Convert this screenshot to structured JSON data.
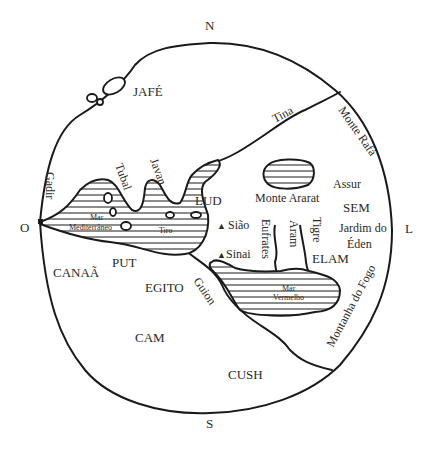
{
  "map": {
    "title": "Mapa-múndi da Tabela das Nações",
    "compass": {
      "north": "N",
      "south": "S",
      "east": "L",
      "west": "O"
    },
    "regions": [
      {
        "id": "jafe",
        "label": "JAFÉ"
      },
      {
        "id": "sem",
        "label": "SEM"
      },
      {
        "id": "cam",
        "label": "CAM"
      },
      {
        "id": "canaa",
        "label": "CANAÃ"
      },
      {
        "id": "put",
        "label": "PUT"
      },
      {
        "id": "egito",
        "label": "EGITO"
      },
      {
        "id": "cush",
        "label": "CUSH"
      },
      {
        "id": "lud",
        "label": "LUD"
      },
      {
        "id": "elam",
        "label": "ELAM"
      },
      {
        "id": "assur",
        "label": "Assur"
      }
    ],
    "places": [
      {
        "id": "gadir",
        "label": "Gadir"
      },
      {
        "id": "tubal",
        "label": "Tubal"
      },
      {
        "id": "javan",
        "label": "Javan"
      },
      {
        "id": "tiro",
        "label": "Tiro"
      },
      {
        "id": "tina",
        "label": "Tina"
      },
      {
        "id": "aram",
        "label": "Aram"
      },
      {
        "id": "guion",
        "label": "Guion"
      },
      {
        "id": "jardim",
        "label_line1": "Jardim do",
        "label_line2": "Éden"
      }
    ],
    "mountains": [
      {
        "id": "siao",
        "label": "Sião",
        "symbol": "▲"
      },
      {
        "id": "sinai",
        "label": "Sinai",
        "symbol": "▲"
      },
      {
        "id": "ararat",
        "label": "Monte Ararat"
      },
      {
        "id": "rafa",
        "label": "Monte Rafá"
      },
      {
        "id": "fogo",
        "label": "Montanha do Fogo"
      }
    ],
    "rivers": [
      {
        "id": "eufrates",
        "label": "Eufrates"
      },
      {
        "id": "tigre",
        "label": "Tigre"
      }
    ],
    "seas": [
      {
        "id": "mediterraneo",
        "label_line1": "Mar",
        "label_line2": "Mediterrâneo"
      },
      {
        "id": "vermelho",
        "label_line1": "Mar",
        "label_line2": "Vermelho"
      }
    ],
    "colors": {
      "ink": "#1a1a1a",
      "paper": "#ffffff",
      "text": "#2a2a2a"
    }
  }
}
